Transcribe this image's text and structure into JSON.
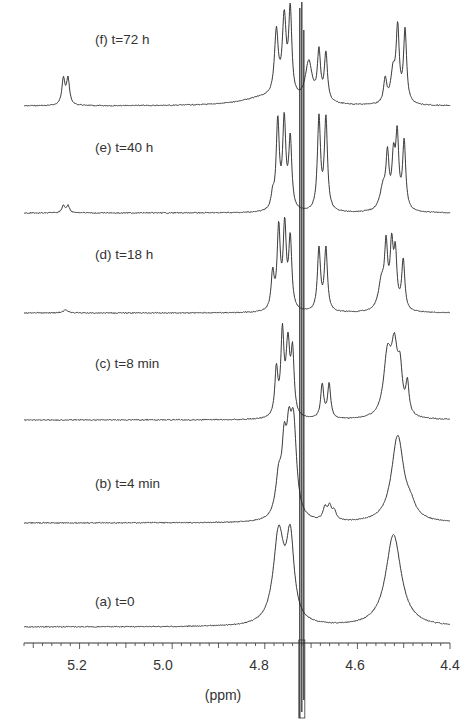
{
  "chart_data": {
    "type": "line",
    "title": "",
    "xlabel": "(ppm)",
    "ylabel": "",
    "x_reversed": true,
    "xlim": [
      5.32,
      4.4
    ],
    "x_ticks": [
      5.2,
      5.0,
      4.8,
      4.6,
      4.4
    ],
    "x_tick_labels": [
      "5.2",
      "5.0",
      "4.8",
      "4.6",
      "4.4"
    ],
    "minor_tick_step": 0.02,
    "grid": false,
    "legend": "none (inline labels per stacked trace)",
    "solvent_peak_ppm": 4.72,
    "series": [
      {
        "name": "(f) t=72 h",
        "label": "(f) t=72 h",
        "peaks": [
          {
            "ppm": 5.235,
            "height": 26,
            "width": 0.004
          },
          {
            "ppm": 5.225,
            "height": 26,
            "width": 0.004
          },
          {
            "ppm": 4.775,
            "height": 64,
            "width": 0.005
          },
          {
            "ppm": 4.758,
            "height": 78,
            "width": 0.005
          },
          {
            "ppm": 4.745,
            "height": 85,
            "width": 0.004
          },
          {
            "ppm": 4.8,
            "height": 8,
            "width": 0.06
          },
          {
            "ppm": 4.705,
            "height": 40,
            "width": 0.009
          },
          {
            "ppm": 4.683,
            "height": 48,
            "width": 0.004
          },
          {
            "ppm": 4.668,
            "height": 48,
            "width": 0.004
          },
          {
            "ppm": 4.54,
            "height": 24,
            "width": 0.004
          },
          {
            "ppm": 4.523,
            "height": 30,
            "width": 0.006
          },
          {
            "ppm": 4.513,
            "height": 72,
            "width": 0.004
          },
          {
            "ppm": 4.497,
            "height": 72,
            "width": 0.004
          }
        ]
      },
      {
        "name": "(e) t=40 h",
        "label": "(e) t=40 h",
        "peaks": [
          {
            "ppm": 5.235,
            "height": 7,
            "width": 0.004
          },
          {
            "ppm": 5.225,
            "height": 7,
            "width": 0.004
          },
          {
            "ppm": 4.783,
            "height": 14,
            "width": 0.004
          },
          {
            "ppm": 4.772,
            "height": 88,
            "width": 0.004
          },
          {
            "ppm": 4.758,
            "height": 88,
            "width": 0.004
          },
          {
            "ppm": 4.745,
            "height": 70,
            "width": 0.004
          },
          {
            "ppm": 4.683,
            "height": 92,
            "width": 0.004
          },
          {
            "ppm": 4.668,
            "height": 92,
            "width": 0.004
          },
          {
            "ppm": 4.545,
            "height": 22,
            "width": 0.008
          },
          {
            "ppm": 4.535,
            "height": 50,
            "width": 0.004
          },
          {
            "ppm": 4.522,
            "height": 48,
            "width": 0.004
          },
          {
            "ppm": 4.514,
            "height": 70,
            "width": 0.004
          },
          {
            "ppm": 4.499,
            "height": 68,
            "width": 0.004
          }
        ]
      },
      {
        "name": "(d) t=18 h",
        "label": "(d) t=18 h",
        "peaks": [
          {
            "ppm": 5.23,
            "height": 3,
            "width": 0.006
          },
          {
            "ppm": 4.783,
            "height": 36,
            "width": 0.004
          },
          {
            "ppm": 4.77,
            "height": 80,
            "width": 0.004
          },
          {
            "ppm": 4.757,
            "height": 82,
            "width": 0.004
          },
          {
            "ppm": 4.745,
            "height": 70,
            "width": 0.004
          },
          {
            "ppm": 4.683,
            "height": 62,
            "width": 0.004
          },
          {
            "ppm": 4.668,
            "height": 62,
            "width": 0.004
          },
          {
            "ppm": 4.548,
            "height": 28,
            "width": 0.008
          },
          {
            "ppm": 4.538,
            "height": 58,
            "width": 0.004
          },
          {
            "ppm": 4.526,
            "height": 60,
            "width": 0.004
          },
          {
            "ppm": 4.518,
            "height": 52,
            "width": 0.004
          },
          {
            "ppm": 4.501,
            "height": 50,
            "width": 0.004
          }
        ]
      },
      {
        "name": "(c) t=8 min",
        "label": "(c) t=8 min",
        "peaks": [
          {
            "ppm": 4.775,
            "height": 46,
            "width": 0.004
          },
          {
            "ppm": 4.762,
            "height": 80,
            "width": 0.004
          },
          {
            "ppm": 4.75,
            "height": 70,
            "width": 0.005
          },
          {
            "ppm": 4.74,
            "height": 60,
            "width": 0.004
          },
          {
            "ppm": 4.676,
            "height": 34,
            "width": 0.004
          },
          {
            "ppm": 4.661,
            "height": 34,
            "width": 0.004
          },
          {
            "ppm": 4.535,
            "height": 60,
            "width": 0.01
          },
          {
            "ppm": 4.52,
            "height": 60,
            "width": 0.008
          },
          {
            "ppm": 4.508,
            "height": 40,
            "width": 0.006
          },
          {
            "ppm": 4.492,
            "height": 30,
            "width": 0.004
          }
        ]
      },
      {
        "name": "(b) t=4 min",
        "label": "(b) t=4 min",
        "peaks": [
          {
            "ppm": 4.77,
            "height": 38,
            "width": 0.008
          },
          {
            "ppm": 4.758,
            "height": 60,
            "width": 0.006
          },
          {
            "ppm": 4.748,
            "height": 60,
            "width": 0.006
          },
          {
            "ppm": 4.738,
            "height": 90,
            "width": 0.008
          },
          {
            "ppm": 4.67,
            "height": 12,
            "width": 0.005
          },
          {
            "ppm": 4.66,
            "height": 13,
            "width": 0.005
          },
          {
            "ppm": 4.65,
            "height": 9,
            "width": 0.005
          },
          {
            "ppm": 4.513,
            "height": 86,
            "width": 0.016
          },
          {
            "ppm": 4.485,
            "height": 10,
            "width": 0.012
          }
        ]
      },
      {
        "name": "(a) t=0",
        "label": "(a) t=0",
        "peaks": [
          {
            "ppm": 4.77,
            "height": 90,
            "width": 0.014
          },
          {
            "ppm": 4.745,
            "height": 80,
            "width": 0.01
          },
          {
            "ppm": 4.522,
            "height": 92,
            "width": 0.02
          }
        ]
      }
    ]
  },
  "labels": {
    "f": "(f) t=72 h",
    "e": "(e) t=40 h",
    "d": "(d) t=18 h",
    "c": "(c) t=8 min",
    "b": "(b) t=4 min",
    "a": "(a) t=0"
  },
  "axis": {
    "title": "(ppm)",
    "ticks": [
      "5.2",
      "5.0",
      "4.8",
      "4.6",
      "4.4"
    ]
  },
  "colors": {
    "trace": "#3a3a3a",
    "axis": "#333333",
    "background": "#ffffff"
  }
}
